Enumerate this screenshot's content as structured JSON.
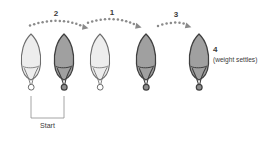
{
  "diagram": {
    "colors": {
      "light_body": "#ededed",
      "dark_body": "#a0a0a0",
      "light_outline": "#6d6d6d",
      "dark_outline": "#3f3f3f",
      "dot_gray": "#8a8a8a",
      "bracket_gray": "#8e8e8e",
      "text_gray": "#3a3a3a",
      "background": "#ffffff"
    },
    "lures": [
      {
        "id": "lure-1",
        "shade": "light",
        "cx": 31,
        "label": ""
      },
      {
        "id": "lure-2",
        "shade": "dark",
        "cx": 64,
        "label": ""
      },
      {
        "id": "lure-3",
        "shade": "light",
        "cx": 100,
        "label": ""
      },
      {
        "id": "lure-4",
        "shade": "dark",
        "cx": 146,
        "label": ""
      },
      {
        "id": "lure-5",
        "shade": "dark",
        "cx": 199,
        "label": ""
      }
    ],
    "motion_arrows": [
      {
        "id": "arrow-2",
        "label": "2",
        "label_x": 56,
        "label_y": 16
      },
      {
        "id": "arrow-1",
        "label": "1",
        "label_x": 112,
        "label_y": 15
      },
      {
        "id": "arrow-3",
        "label": "3",
        "label_x": 176,
        "label_y": 17
      }
    ],
    "annotations": [
      {
        "id": "settle-number",
        "text": "4",
        "x": 213,
        "y": 52
      },
      {
        "id": "settle-caption",
        "text": "(weight settles)",
        "x": 213,
        "y": 62
      }
    ],
    "start_bracket": {
      "id": "start-bracket",
      "label": "Start",
      "label_x": 54,
      "label_y": 128,
      "left_x": 31,
      "right_x": 64,
      "top_y": 96,
      "bottom_y": 118
    }
  }
}
